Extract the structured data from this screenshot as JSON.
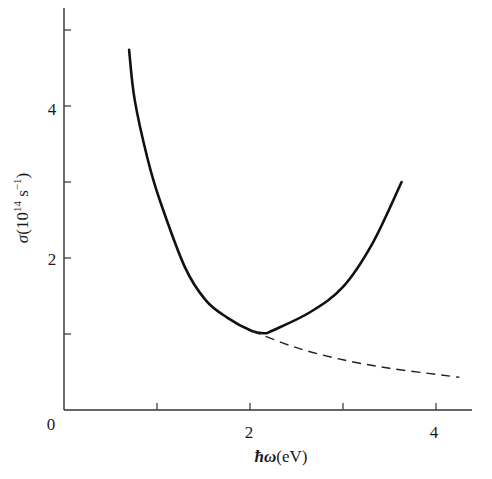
{
  "chart_data": {
    "type": "line",
    "title": "",
    "xlabel": "ħω(eV)",
    "ylabel": "σ(10¹⁴ s⁻¹)",
    "xlim": [
      0,
      4.4
    ],
    "ylim": [
      0,
      5.2
    ],
    "grid": false,
    "legend": null,
    "x_ticks": [
      {
        "value": 0,
        "label": "0"
      },
      {
        "value": 1,
        "label": ""
      },
      {
        "value": 2,
        "label": "2"
      },
      {
        "value": 3,
        "label": ""
      },
      {
        "value": 4,
        "label": "4"
      }
    ],
    "y_ticks": [
      {
        "value": 1,
        "label": ""
      },
      {
        "value": 2,
        "label": "2"
      },
      {
        "value": 3,
        "label": ""
      },
      {
        "value": 4,
        "label": "4"
      },
      {
        "value": 5,
        "label": ""
      }
    ],
    "series": [
      {
        "name": "measured",
        "style": "solid",
        "x": [
          0.7,
          0.76,
          0.9,
          1.03,
          1.3,
          1.52,
          1.75,
          2.02,
          2.16,
          2.25,
          2.65,
          3.0,
          3.32,
          3.63
        ],
        "y": [
          4.74,
          4.08,
          3.3,
          2.76,
          1.88,
          1.45,
          1.22,
          1.04,
          1.01,
          1.05,
          1.29,
          1.62,
          2.2,
          3.0
        ]
      },
      {
        "name": "extrapolated",
        "style": "dashed",
        "x": [
          2.02,
          2.5,
          3.0,
          3.5,
          4.0,
          4.25
        ],
        "y": [
          1.04,
          0.82,
          0.66,
          0.55,
          0.47,
          0.43
        ]
      }
    ]
  },
  "labels": {
    "origin": "0",
    "x_tick_2": "2",
    "x_tick_4": "4",
    "y_tick_2": "2",
    "y_tick_4": "4",
    "x_title_symbol": "ħω",
    "x_title_unit": "(eV)",
    "y_title_symbol": "σ",
    "y_title_unit_prefix": "(10",
    "y_title_exp": "14",
    "y_title_unit_mid": " s",
    "y_title_exp2": "−1",
    "y_title_close": ")"
  },
  "colors": {
    "line": "#111111",
    "axis": "#333333"
  }
}
